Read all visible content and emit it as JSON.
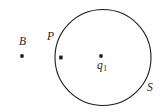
{
  "figure": {
    "background_color": "#fefefe",
    "stroke_color": "#1c1c1c",
    "width": 162,
    "height": 112
  },
  "circle": {
    "name": "S",
    "center_x": 103,
    "center_y": 57.5,
    "radius": 48,
    "stroke_width": 1.1,
    "label": "S",
    "label_x": 150,
    "label_y": 88
  },
  "points": [
    {
      "id": "B",
      "label": "B",
      "x": 22,
      "y": 56,
      "marker": "dot",
      "location": "outside-circle"
    },
    {
      "id": "P",
      "label": "P",
      "x": 61,
      "y": 57.5,
      "marker": "dot",
      "location": "on-circle"
    },
    {
      "id": "q1",
      "label": "q",
      "subscript": "1",
      "x": 101,
      "y": 56,
      "marker": "dot",
      "location": "center"
    }
  ]
}
